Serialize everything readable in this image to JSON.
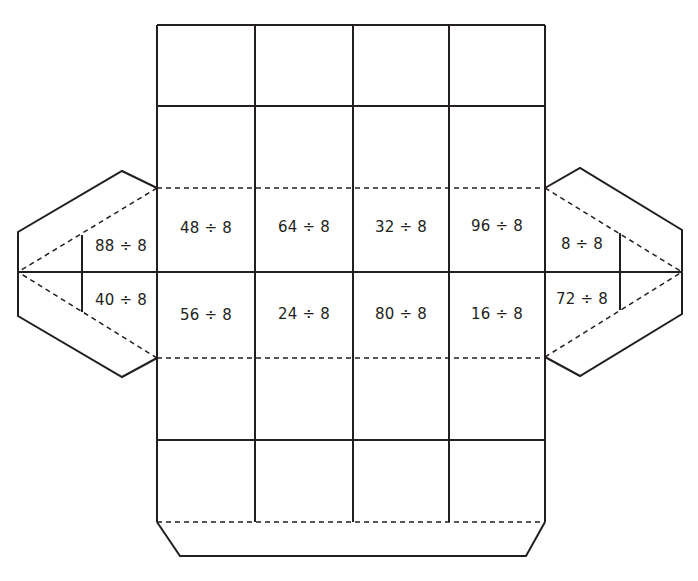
{
  "diagram": {
    "type": "box-net-division-puzzle",
    "stroke_color": "#231f20",
    "background": "#ffffff",
    "main_grid": {
      "columns": 4,
      "top_row_problems": [
        "48 ÷ 8",
        "64 ÷ 8",
        "32 ÷ 8",
        "96 ÷ 8"
      ],
      "bottom_row_problems": [
        "56 ÷ 8",
        "24 ÷ 8",
        "80 ÷ 8",
        "16 ÷ 8"
      ]
    },
    "left_flap": {
      "top": "88 ÷ 8",
      "bottom": "40 ÷ 8"
    },
    "right_flap": {
      "top": "8 ÷ 8",
      "bottom": "72 ÷ 8"
    }
  }
}
